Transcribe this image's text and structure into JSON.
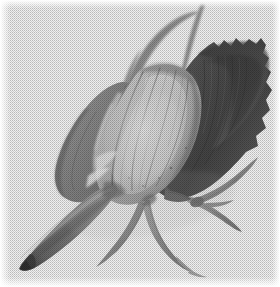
{
  "image": {
    "kind": "photograph",
    "subject": "flower-bud-specimen",
    "description": "Grayscale halftone photograph of a botanical specimen: a closed flower bud or seed pod with overlapping sepals, a tapered spur at lower left, thin curving awns at the top and crossing stems at lower right.",
    "medium": "halftone-printed-photograph",
    "background": "#ffffff",
    "width": 280,
    "height": 287,
    "has_text": false,
    "has_border": false,
    "palette": {
      "paper_white": "#ffffff",
      "highlight": "#e2e2e2",
      "light_gray": "#c8c8c8",
      "mid_light_gray": "#aeaeae",
      "mid_gray": "#939393",
      "mid_dark_gray": "#7a7a7a",
      "dark_gray": "#5e5e5e",
      "deep_shadow": "#434343",
      "darkest": "#2e2e2e"
    },
    "parts": [
      {
        "name": "upper-awn-left",
        "label": "Upper left awn",
        "tone": "#8d8d8d",
        "note": "Long slender appendage arcing from the bud crown up and to the right, cresting near the top edge."
      },
      {
        "name": "upper-awn-right",
        "label": "Upper right awn",
        "tone": "#9a9a9a",
        "note": "Second thin awn descending diagonally from the top edge into the dark right sepal."
      },
      {
        "name": "sepal-left-lobe",
        "label": "Left sepal lobe",
        "tone": "#919191",
        "note": "Mid-gray lobe with a sharp folded left margin and a pale highlight ridge."
      },
      {
        "name": "sepal-center",
        "label": "Central sepals",
        "tone": "#c4c4c4",
        "note": "Pale overlapping sepals forming the lit face of the bud, separated by dark creases."
      },
      {
        "name": "sepal-right-dark",
        "label": "Right sepal",
        "tone": "#575757",
        "note": "Largest, darkest sepal mass on the right with a jagged torn upper and right margin."
      },
      {
        "name": "pod-spur",
        "label": "Lower spur pod",
        "tone": "#8a8a8a",
        "note": "Elongated tapering pod angling down to the lower left, ending in a blunt dark tip."
      },
      {
        "name": "stem-cross",
        "label": "Crossing stems",
        "tone": "#9f9f9f",
        "note": "Two slender stems crossing in an X at the lower right of the bud."
      },
      {
        "name": "stem-fork",
        "label": "Forked lower stem",
        "tone": "#a5a5a5",
        "note": "Stem forking and curving downward beneath the bud toward the bottom edge."
      }
    ]
  }
}
